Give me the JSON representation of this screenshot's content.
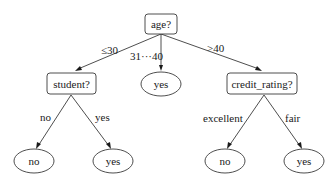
{
  "diagram": {
    "type": "decision-tree",
    "nodes": [
      {
        "id": "age",
        "label": "age?",
        "kind": "decision"
      },
      {
        "id": "student",
        "label": "student?",
        "kind": "decision"
      },
      {
        "id": "mid_yes",
        "label": "yes",
        "kind": "leaf"
      },
      {
        "id": "credit",
        "label": "credit_rating?",
        "kind": "decision"
      },
      {
        "id": "student_no",
        "label": "no",
        "kind": "leaf"
      },
      {
        "id": "student_yes",
        "label": "yes",
        "kind": "leaf"
      },
      {
        "id": "credit_no",
        "label": "no",
        "kind": "leaf"
      },
      {
        "id": "credit_yes",
        "label": "yes",
        "kind": "leaf"
      }
    ],
    "edges": [
      {
        "from": "age",
        "to": "student",
        "label": "≤30"
      },
      {
        "from": "age",
        "to": "mid_yes",
        "label": "31···40"
      },
      {
        "from": "age",
        "to": "credit",
        "label": ">40"
      },
      {
        "from": "student",
        "to": "student_no",
        "label": "no"
      },
      {
        "from": "student",
        "to": "student_yes",
        "label": "yes"
      },
      {
        "from": "credit",
        "to": "credit_no",
        "label": "excellent"
      },
      {
        "from": "credit",
        "to": "credit_yes",
        "label": "fair"
      }
    ]
  }
}
